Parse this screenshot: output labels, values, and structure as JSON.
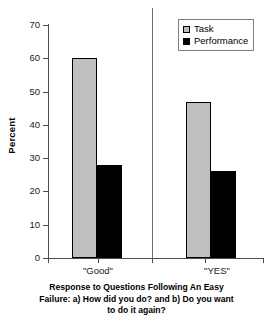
{
  "chart_data": {
    "type": "bar",
    "title": "",
    "subtitle": "",
    "xlabel": "Response to Questions Following An Easy Failure: a) How did you do? and b) Do you want to do it again?",
    "ylabel": "Percent",
    "ylim": [
      0,
      70
    ],
    "yticks": [
      0,
      10,
      20,
      30,
      40,
      50,
      60,
      70
    ],
    "ytick_labels": [
      "0",
      "10",
      "20",
      "30",
      "40",
      "50",
      "60",
      "70"
    ],
    "grid": false,
    "legend_position": "top-right",
    "categories": [
      "\"Good\"",
      "\"YES\""
    ],
    "series": [
      {
        "name": "Task",
        "color": "#bfbfbf",
        "values": [
          60,
          47
        ]
      },
      {
        "name": "Performance",
        "color": "#000000",
        "values": [
          28,
          26
        ]
      }
    ],
    "group_divider": true,
    "caption_lines": [
      "Response to Questions Following An Easy",
      "Failure: a) How did you do? and b) Do you want",
      "to do it again?"
    ]
  },
  "legend": {
    "items": [
      {
        "label": "Task",
        "swatch": "task-swatch"
      },
      {
        "label": "Performance",
        "swatch": "performance-swatch"
      }
    ]
  },
  "axes": {
    "y_title": "Percent",
    "y_labels": [
      "70",
      "60",
      "50",
      "40",
      "30",
      "20",
      "10",
      "0"
    ],
    "x_labels": [
      "\"Good\"",
      "\"YES\""
    ]
  },
  "caption": {
    "line1": "Response to Questions Following An Easy",
    "line2": "Failure: a) How did you do? and b) Do you want",
    "line3": "to do it again?"
  }
}
